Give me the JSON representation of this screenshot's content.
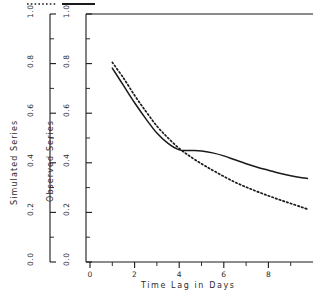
{
  "chart_data": {
    "type": "line",
    "title": "",
    "xlabel": "Time Lag in Days",
    "xlim": [
      0,
      10
    ],
    "xticks": [
      0,
      2,
      4,
      6,
      8
    ],
    "xticklabels": [
      "0",
      "2",
      "4",
      "6",
      "8"
    ],
    "xminorticks": [
      1,
      3,
      5,
      7,
      9
    ],
    "grid": false,
    "legend_position": "top",
    "axes": [
      {
        "name": "simulated-axis",
        "label": "Simulated Series",
        "ylim": [
          0.0,
          1.0
        ],
        "yticks": [
          0.0,
          0.2,
          0.4,
          0.6,
          0.8,
          1.0
        ],
        "yticklabels": [
          "0.0",
          "0.2",
          "0.4",
          "0.6",
          "0.8",
          "1.0"
        ],
        "yminorticks": [
          0.1,
          0.3,
          0.5,
          0.7,
          0.9
        ]
      },
      {
        "name": "observed-axis",
        "label": "Observed Series",
        "ylim": [
          0.0,
          1.0
        ],
        "yticks": [
          0.0,
          0.2,
          0.4,
          0.6,
          0.8,
          1.0
        ],
        "yticklabels": [
          "0.0",
          "0.2",
          "0.4",
          "0.6",
          "0.8",
          "1.0"
        ],
        "yminorticks": [
          0.1,
          0.3,
          0.5,
          0.7,
          0.9
        ]
      }
    ],
    "series": [
      {
        "name": "Simulated Series",
        "style": "dotted",
        "color": "#1a1a1a",
        "axis": "simulated-axis",
        "x": [
          1.0,
          1.5,
          2.0,
          2.5,
          3.0,
          3.5,
          4.0,
          4.5,
          5.0,
          5.5,
          6.0,
          6.5,
          7.0,
          7.5,
          8.0,
          8.5,
          9.0,
          9.5,
          9.75
        ],
        "y": [
          0.805,
          0.742,
          0.672,
          0.608,
          0.548,
          0.5,
          0.458,
          0.425,
          0.396,
          0.37,
          0.345,
          0.322,
          0.302,
          0.284,
          0.267,
          0.251,
          0.236,
          0.221,
          0.213
        ]
      },
      {
        "name": "Observed Series",
        "style": "solid",
        "color": "#1a1a1a",
        "axis": "observed-axis",
        "x": [
          1.0,
          1.5,
          2.0,
          2.5,
          3.0,
          3.5,
          4.0,
          4.5,
          5.0,
          5.5,
          6.0,
          6.5,
          7.0,
          7.5,
          8.0,
          8.5,
          9.0,
          9.5,
          9.75
        ],
        "y": [
          0.782,
          0.712,
          0.642,
          0.578,
          0.52,
          0.478,
          0.452,
          0.45,
          0.448,
          0.44,
          0.428,
          0.412,
          0.396,
          0.382,
          0.37,
          0.358,
          0.348,
          0.34,
          0.337
        ]
      }
    ],
    "legend": [
      {
        "label": "Simulated Series",
        "style": "dotted"
      },
      {
        "label": "Observed Series",
        "style": "solid"
      }
    ]
  }
}
